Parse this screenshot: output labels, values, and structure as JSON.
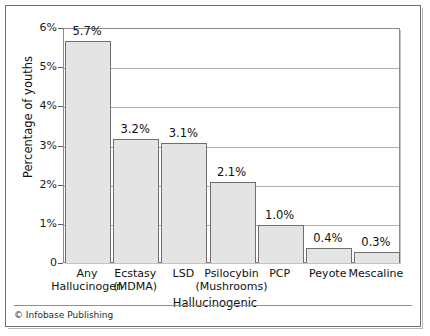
{
  "figure": {
    "credit": "© Infobase Publishing"
  },
  "chart_data": {
    "type": "bar",
    "title": "",
    "xlabel": "Hallucinogenic",
    "ylabel": "Percentage of youths",
    "ylim": [
      0,
      6
    ],
    "grid": true,
    "legend": "none",
    "categories": [
      "Any Hallucinogen",
      "Ecstasy (MDMA)",
      "LSD",
      "Psilocybin (Mushrooms)",
      "PCP",
      "Peyote",
      "Mescaline"
    ],
    "category_lines": [
      [
        "Any",
        "Hallucinogen"
      ],
      [
        "Ecstasy",
        "(MDMA)"
      ],
      [
        "LSD",
        ""
      ],
      [
        "Psilocybin",
        "(Mushrooms)"
      ],
      [
        "PCP",
        ""
      ],
      [
        "Peyote",
        ""
      ],
      [
        "Mescaline",
        ""
      ]
    ],
    "values": [
      5.7,
      3.2,
      3.1,
      2.1,
      1.0,
      0.4,
      0.3
    ],
    "value_labels": [
      "5.7%",
      "3.2%",
      "3.1%",
      "2.1%",
      "1.0%",
      "0.4%",
      "0.3%"
    ],
    "ytick_values": [
      0,
      1,
      2,
      3,
      4,
      5,
      6
    ],
    "ytick_labels": [
      "0",
      "1%",
      "2%",
      "3%",
      "4%",
      "5%",
      "6%"
    ],
    "colors": {
      "bar_fill": "#e4e4e4",
      "bar_border": "#6f6f6f",
      "gridline": "#b0b0b0",
      "axis": "#8a8a8a",
      "text": "#111111",
      "background": "#ffffff"
    }
  }
}
